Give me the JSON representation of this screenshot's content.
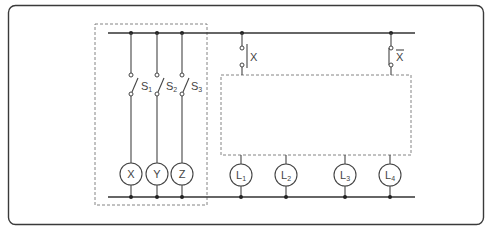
{
  "diagram": {
    "title": "",
    "switches": [
      {
        "id": "S1",
        "label": "S",
        "sub": "1",
        "x": 131
      },
      {
        "id": "S2",
        "label": "S",
        "sub": "2",
        "x": 157
      },
      {
        "id": "S3",
        "label": "S",
        "sub": "3",
        "x": 182
      }
    ],
    "relays": [
      {
        "id": "X",
        "label": "X",
        "x": 131
      },
      {
        "id": "Y",
        "label": "Y",
        "x": 156
      },
      {
        "id": "Z",
        "label": "Z",
        "x": 181
      }
    ],
    "contacts": [
      {
        "id": "X_no",
        "label": "X",
        "type": "normally-open",
        "x": 242
      },
      {
        "id": "X_nc",
        "label": "X",
        "overline": true,
        "type": "normally-closed",
        "x": 391
      }
    ],
    "lamps": [
      {
        "id": "L1",
        "label": "L",
        "sub": "1",
        "x": 241
      },
      {
        "id": "L2",
        "label": "L",
        "sub": "2",
        "x": 286
      },
      {
        "id": "L3",
        "label": "L",
        "sub": "3",
        "x": 345
      },
      {
        "id": "L4",
        "label": "L",
        "sub": "4",
        "x": 390
      }
    ],
    "colors": {
      "line": "#333333",
      "dashed": "#777777",
      "background": "#ffffff"
    }
  }
}
